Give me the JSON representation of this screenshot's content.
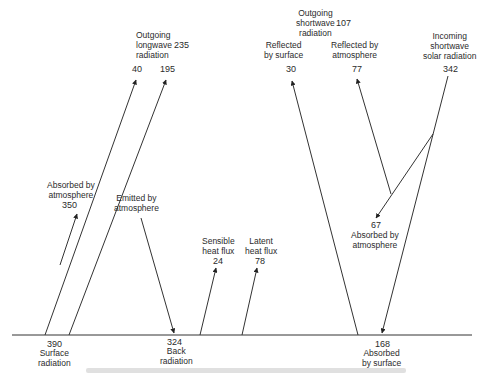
{
  "diagram": {
    "labels": {
      "outgoing_longwave": "Outgoing\nlongwave\nradiation",
      "outgoing_longwave_value": "235",
      "lw_40": "40",
      "lw_195": "195",
      "outgoing_shortwave": "Outgoing\nshortwave\nradiation",
      "outgoing_shortwave_value": "107",
      "reflected_surface": "Reflected\nby surface",
      "reflected_surface_value": "30",
      "reflected_atmosphere": "Reflected by\natmosphere",
      "reflected_atmosphere_value": "77",
      "incoming_solar": "Incoming\nshortwave\nsolar radiation",
      "incoming_solar_value": "342",
      "absorbed_atm_lw": "Absorbed by\natmosphere",
      "absorbed_atm_lw_value": "350",
      "emitted_atm": "Emitted by\natmosphere",
      "sensible_heat": "Sensible\nheat flux",
      "sensible_heat_value": "24",
      "latent_heat": "Latent\nheat flux",
      "latent_heat_value": "78",
      "absorbed_atm_sw_value": "67",
      "absorbed_atm_sw": "Absorbed by\natmosphere",
      "surface_radiation_value": "390",
      "surface_radiation": "Surface\nradiation",
      "back_radiation_value": "324",
      "back_radiation": "Back\nradiation",
      "absorbed_surface_value": "168",
      "absorbed_surface": "Absorbed\nby surface"
    },
    "colors": {
      "line": "#333333",
      "background": "#ffffff",
      "text": "#2b2b2b"
    }
  }
}
